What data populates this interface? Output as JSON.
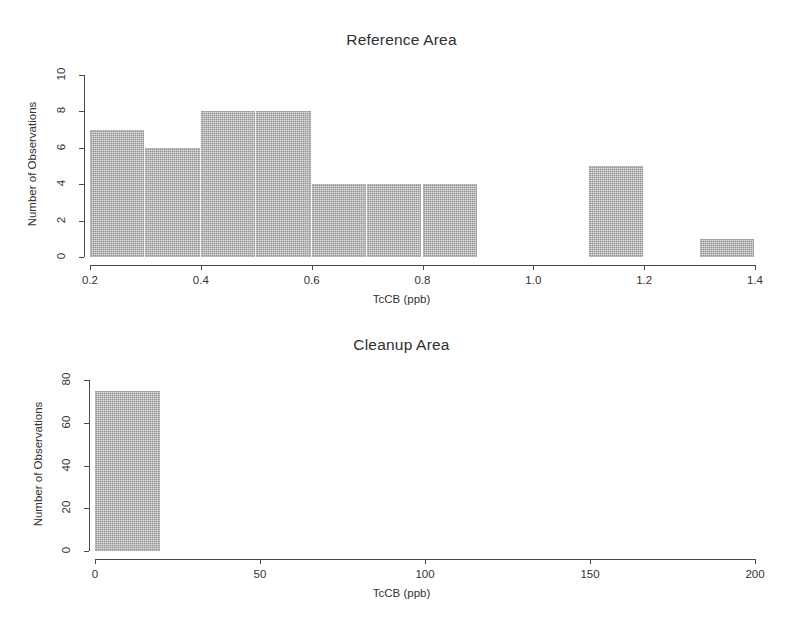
{
  "figure": {
    "background_color": "#ffffff",
    "bar_fill_color": "#aaaaaa",
    "axis_color": "#4a4a4a"
  },
  "chart_data": [
    {
      "type": "bar",
      "title": "Reference Area",
      "xlabel": "TcCB (ppb)",
      "ylabel": "Number of Observations",
      "xlim": [
        0.2,
        1.4
      ],
      "ylim": [
        0,
        10
      ],
      "grid": false,
      "legend": "none",
      "xticks": [
        "0.2",
        "0.4",
        "0.6",
        "0.8",
        "1.0",
        "1.2",
        "1.4"
      ],
      "xtick_values": [
        0.2,
        0.4,
        0.6,
        0.8,
        1.0,
        1.2,
        1.4
      ],
      "yticks": [
        "0",
        "2",
        "4",
        "6",
        "8",
        "10"
      ],
      "ytick_values": [
        0,
        2,
        4,
        6,
        8,
        10
      ],
      "bin_width": 0.1,
      "bin_edges": [
        0.2,
        0.3,
        0.4,
        0.5,
        0.6,
        0.7,
        0.8,
        0.9,
        1.0,
        1.1,
        1.2,
        1.3,
        1.4
      ],
      "categories": [
        "0.2-0.3",
        "0.3-0.4",
        "0.4-0.5",
        "0.5-0.6",
        "0.6-0.7",
        "0.7-0.8",
        "0.8-0.9",
        "0.9-1.0",
        "1.0-1.1",
        "1.1-1.2",
        "1.2-1.3",
        "1.3-1.4"
      ],
      "values": [
        7,
        6,
        8,
        8,
        4,
        4,
        4,
        0,
        0,
        5,
        0,
        1
      ]
    },
    {
      "type": "bar",
      "title": "Cleanup Area",
      "xlabel": "TcCB (ppb)",
      "ylabel": "Number of Observations",
      "xlim": [
        0,
        200
      ],
      "ylim": [
        0,
        80
      ],
      "grid": false,
      "legend": "none",
      "xticks": [
        "0",
        "50",
        "100",
        "150",
        "200"
      ],
      "xtick_values": [
        0,
        50,
        100,
        150,
        200
      ],
      "yticks": [
        "0",
        "20",
        "40",
        "60",
        "80"
      ],
      "ytick_values": [
        0,
        20,
        40,
        60,
        80
      ],
      "bin_width": 20,
      "bin_edges": [
        0,
        20,
        40,
        60,
        80,
        100,
        120,
        140,
        160,
        180,
        200
      ],
      "categories": [
        "0-20",
        "20-40",
        "40-60",
        "60-80",
        "80-100",
        "100-120",
        "120-140",
        "140-160",
        "160-180",
        "180-200"
      ],
      "values": [
        75,
        0,
        0,
        0,
        0,
        0,
        0,
        0,
        0,
        0
      ]
    }
  ]
}
